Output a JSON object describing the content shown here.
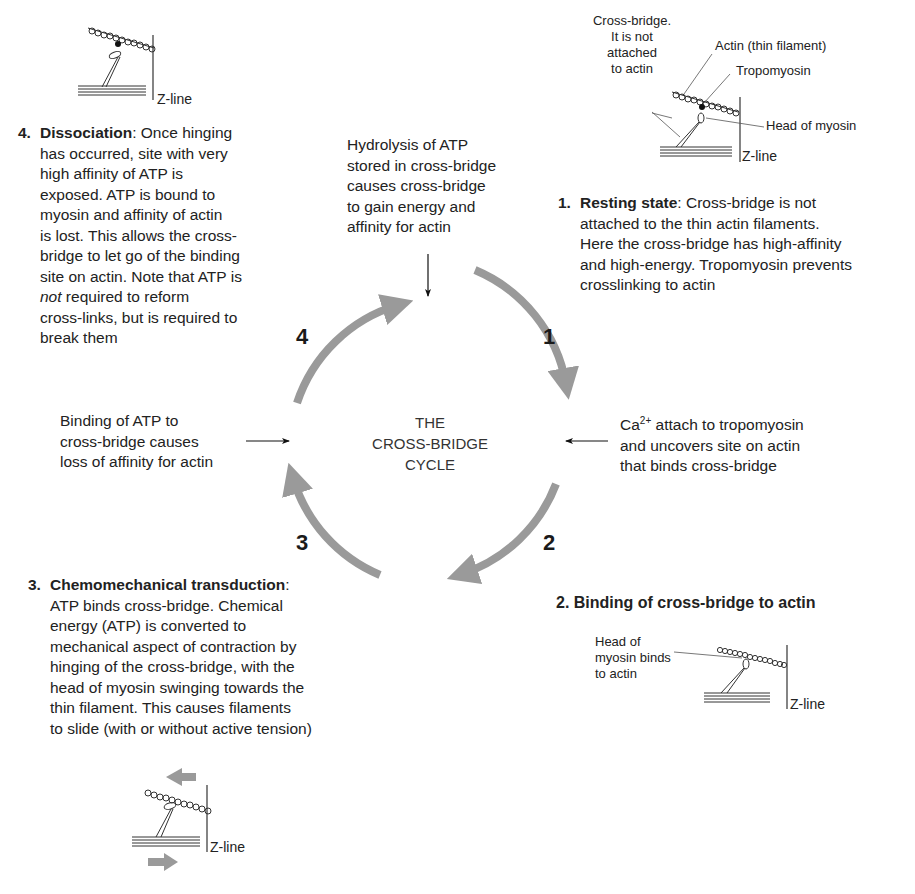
{
  "diagram": {
    "title_lines": [
      "THE",
      "CROSS-BRIDGE",
      "CYCLE"
    ],
    "arrow_color": "#9a9a9a",
    "cycle_numbers": [
      "1",
      "2",
      "3",
      "4"
    ]
  },
  "annotations": {
    "top": "Hydrolysis of ATP stored in cross-bridge causes cross-bridge to gain energy and affinity for actin",
    "top_lines": [
      "Hydrolysis of ATP",
      "stored in cross-bridge",
      "causes cross-bridge",
      "to gain energy and",
      "affinity for actin"
    ],
    "right_lines": [
      "attach to tropomyosin",
      "and uncovers site on actin",
      "that binds cross-bridge"
    ],
    "right_ion": "Ca",
    "right_ion_charge": "2+",
    "left_lines": [
      "Binding of ATP to",
      "cross-bridge causes",
      "loss of affinity for actin"
    ]
  },
  "steps": [
    {
      "number": "1.",
      "title": "Resting state",
      "lines_first": ": Cross-bridge is not",
      "lines": [
        "attached to the thin actin filaments.",
        "Here the cross-bridge has high-affinity",
        "and high-energy. Tropomyosin prevents",
        "crosslinking to actin"
      ]
    },
    {
      "number": "2.",
      "title": "Binding of cross-bridge to actin"
    },
    {
      "number": "3.",
      "title": "Chemomechanical transduction",
      "lines_first": ":",
      "lines": [
        "ATP binds cross-bridge. Chemical",
        "energy (ATP) is converted to",
        "mechanical aspect of contraction by",
        "hinging of the cross-bridge, with the",
        "head of myosin swinging towards the",
        "thin filament. This causes filaments",
        "to slide (with or without active tension)"
      ]
    },
    {
      "number": "4.",
      "title": "Dissociation",
      "lines_first": ": Once hinging",
      "lines": [
        "has occurred, site with very",
        "high affinity of ATP is",
        "exposed. ATP is bound to",
        "myosin and affinity of actin",
        "is lost. This allows the cross-",
        "bridge to let go of the binding",
        "site on actin. Note that ATP is"
      ],
      "italic_word": "not",
      "lines_after_italic": [
        " required to reform",
        "cross-links, but is required to",
        "break them"
      ]
    }
  ],
  "figure_labels": {
    "zline": "Z-line",
    "resting": {
      "cross_bridge_lines": [
        "Cross-bridge.",
        "It is not",
        "attached",
        "to actin"
      ],
      "actin": "Actin (thin filament)",
      "tropomyosin": "Tropomyosin",
      "head": "Head of myosin"
    },
    "binding": {
      "head_lines": [
        "Head of",
        "myosin binds",
        "to actin"
      ]
    }
  }
}
